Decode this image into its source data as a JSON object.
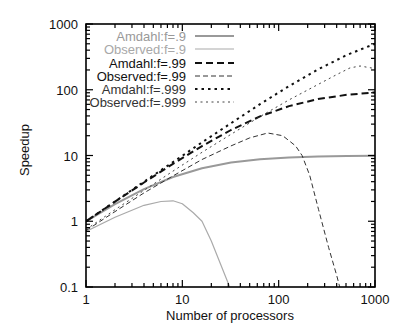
{
  "chart_data": {
    "type": "line",
    "title": "",
    "xlabel": "Number of processors",
    "ylabel": "Speedup",
    "xscale": "log",
    "yscale": "log",
    "xlim": [
      1,
      1000
    ],
    "ylim": [
      0.1,
      1000
    ],
    "x_ticks": [
      1,
      10,
      100,
      1000
    ],
    "x_tick_labels": [
      "1",
      "10",
      "100",
      "1000"
    ],
    "y_ticks": [
      0.1,
      1,
      10,
      100,
      1000
    ],
    "y_tick_labels": [
      "0.1",
      "1",
      "10",
      "100",
      "1000"
    ],
    "grid": false,
    "legend_position": "upper left (inside)",
    "series": [
      {
        "name": "Amdahl:f=.9",
        "color": "#999999",
        "style": "solid",
        "width": 2,
        "x": [
          1,
          2,
          4,
          8,
          16,
          32,
          64,
          128,
          256,
          512,
          1000
        ],
        "y": [
          1.0,
          1.82,
          3.08,
          4.71,
          6.4,
          7.8,
          8.77,
          9.34,
          9.66,
          9.83,
          9.91
        ]
      },
      {
        "name": "Observed:f=.9",
        "color": "#aaaaaa",
        "style": "solid",
        "width": 1.2,
        "x": [
          1,
          2,
          4,
          6,
          8,
          10,
          13,
          16,
          20,
          25,
          31
        ],
        "y": [
          0.7,
          1.15,
          1.75,
          2.0,
          2.05,
          1.85,
          1.35,
          1.0,
          0.5,
          0.22,
          0.1
        ]
      },
      {
        "name": "Amdahl:f=.99",
        "color": "#111111",
        "style": "dash-bold",
        "width": 2,
        "x": [
          1,
          2,
          4,
          8,
          16,
          32,
          64,
          128,
          256,
          512,
          1000
        ],
        "y": [
          1.0,
          1.98,
          3.88,
          7.48,
          13.9,
          24.4,
          39.3,
          56.4,
          72.1,
          83.8,
          91.0
        ]
      },
      {
        "name": "Observed:f=.99",
        "color": "#333333",
        "style": "dash-thin",
        "width": 1,
        "x": [
          1,
          2,
          4,
          8,
          16,
          32,
          50,
          77,
          110,
          150,
          175,
          210,
          260,
          330,
          400,
          430
        ],
        "y": [
          0.72,
          1.4,
          2.7,
          4.9,
          8.7,
          14.0,
          18.5,
          22.0,
          20.0,
          14.0,
          10.0,
          5.0,
          1.5,
          0.4,
          0.15,
          0.1
        ]
      },
      {
        "name": "Amdahl:f=.999",
        "color": "#111111",
        "style": "dot-bold",
        "width": 2,
        "x": [
          1,
          2,
          4,
          8,
          16,
          32,
          64,
          128,
          256,
          512,
          1000
        ],
        "y": [
          1.0,
          2.0,
          3.99,
          7.94,
          15.8,
          31.0,
          60.2,
          113.5,
          204.0,
          339.0,
          500.0
        ]
      },
      {
        "name": "Observed:f=.999",
        "color": "#444444",
        "style": "dot-thin",
        "width": 1,
        "x": [
          1,
          2,
          4,
          8,
          16,
          32,
          64,
          128,
          256,
          400,
          550,
          700,
          1000
        ],
        "y": [
          0.75,
          1.5,
          2.95,
          5.8,
          11.2,
          21.0,
          39.0,
          70.0,
          120.0,
          170.0,
          215.0,
          230.0,
          210.0
        ]
      }
    ]
  },
  "legend": {
    "items": [
      {
        "label": "Amdahl:f=.9",
        "color": "#999999"
      },
      {
        "label": "Observed:f=.9",
        "color": "#a8a8a8"
      },
      {
        "label": "Amdahl:f=.99",
        "color": "#111111"
      },
      {
        "label": "Observed:f=.99",
        "color": "#111111"
      },
      {
        "label": "Amdahl:f=.999",
        "color": "#333333"
      },
      {
        "label": "Observed:f=.999",
        "color": "#333333"
      }
    ]
  }
}
